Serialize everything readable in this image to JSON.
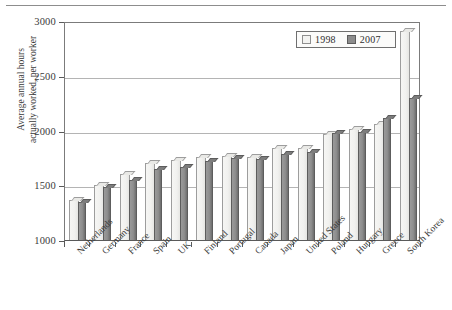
{
  "chart_data": {
    "type": "bar",
    "title": "",
    "subtitle": "",
    "xlabel": "",
    "ylabel": "Average annual hours actually worked, per worker",
    "ylabel_lines": [
      "Average annual hours",
      "actually worked, per worker"
    ],
    "ylim": [
      1000,
      3000
    ],
    "ytick_values": [
      1000,
      1500,
      2000,
      2500,
      3000
    ],
    "ytick_labels": [
      "1000",
      "1500",
      "2000",
      "2500",
      "3000"
    ],
    "grid": "horizontal",
    "legend_position": "top-right",
    "categories": [
      "Netherlands",
      "Germany",
      "France",
      "Spain",
      "UK",
      "Finland",
      "Portugal",
      "Canada",
      "Japan",
      "United States",
      "Poland",
      "Hungary",
      "Greece",
      "South Korea"
    ],
    "series": [
      {
        "name": "1998",
        "color": "#f1f1ef",
        "values": [
          1370,
          1500,
          1600,
          1700,
          1730,
          1760,
          1765,
          1760,
          1840,
          1840,
          1970,
          2010,
          2060,
          2910
        ]
      },
      {
        "name": "2007",
        "color": "#8c8c8c",
        "values": [
          1350,
          1480,
          1550,
          1650,
          1670,
          1720,
          1745,
          1740,
          1790,
          1800,
          1975,
          1990,
          2115,
          2300
        ]
      }
    ]
  },
  "legend": {
    "items": [
      {
        "label": "1998",
        "swatch": "light-swatch"
      },
      {
        "label": "2007",
        "swatch": "dark-swatch"
      }
    ]
  },
  "colors": {
    "bar_1998": "#f1f1ef",
    "bar_2007": "#8c8c8c",
    "axis": "#5a5a5a",
    "gridline": "#b4b4b4",
    "text": "#3a3a3a"
  }
}
